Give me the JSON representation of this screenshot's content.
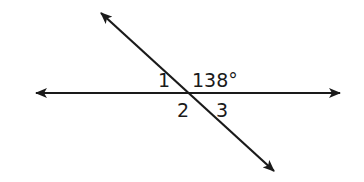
{
  "diagram": {
    "type": "intersecting-lines",
    "line_color": "#1a1a1a",
    "lines": [
      {
        "name": "horizontal-line",
        "x1": 36,
        "y1": 93,
        "x2": 340,
        "y2": 93
      },
      {
        "name": "transversal-line",
        "x1": 101,
        "y1": 13,
        "x2": 274,
        "y2": 171
      }
    ],
    "labels": [
      {
        "name": "angle-1-label",
        "text": "1",
        "x": 158,
        "y": 87
      },
      {
        "name": "angle-138-label",
        "text": "138°",
        "x": 192,
        "y": 87
      },
      {
        "name": "angle-2-label",
        "text": "2",
        "x": 177,
        "y": 117
      },
      {
        "name": "angle-3-label",
        "text": "3",
        "x": 216,
        "y": 117
      }
    ]
  }
}
